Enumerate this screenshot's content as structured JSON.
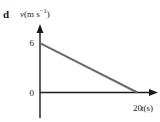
{
  "figure": {
    "part_label": "d",
    "background_color": "#ffffff"
  },
  "chart_data": {
    "type": "line",
    "title": "",
    "subtitle": "",
    "part_label": "d",
    "xlabel": "t(s)",
    "xlabel_symbol": "t",
    "xlabel_unit": "s",
    "ylabel": "v(m s⁻¹)",
    "ylabel_symbol": "v",
    "ylabel_unit_base": "m s",
    "ylabel_unit_exponent": "−1",
    "x_tick_labels": [
      "20"
    ],
    "x_tick_values": [
      20
    ],
    "y_tick_labels": [
      "0",
      "6"
    ],
    "y_tick_values": [
      0,
      6
    ],
    "xlim": [
      0,
      23
    ],
    "ylim": [
      0,
      7.6
    ],
    "grid": false,
    "legend": null,
    "series": [
      {
        "name": "velocity",
        "color": "#6b6b6b",
        "linewidth": 2,
        "x": [
          0,
          20
        ],
        "values": [
          6,
          0
        ]
      }
    ],
    "annotations": [],
    "axis_arrows": {
      "x": "right",
      "y": "up"
    },
    "axis_color": "#1a1a1a",
    "line_color": "#6b6b6b"
  }
}
